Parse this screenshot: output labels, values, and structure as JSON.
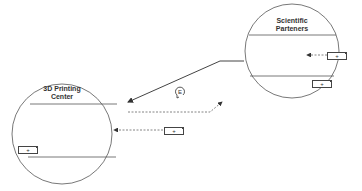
{
  "diagram": {
    "nodes": [
      {
        "id": "printing_center",
        "title_line1": "3D Printing",
        "title_line2": "Center"
      },
      {
        "id": "scientific_partners",
        "title_line1": "Scientific",
        "title_line2": "Parteners"
      }
    ],
    "plus_boxes": [
      {
        "label": "+"
      },
      {
        "label": "+"
      },
      {
        "label": "+"
      },
      {
        "label": "+"
      }
    ],
    "center_icon": {
      "name": "recycle-e-icon",
      "glyph": "E"
    }
  },
  "colors": {
    "stroke": "#555555",
    "background": "#ffffff"
  }
}
